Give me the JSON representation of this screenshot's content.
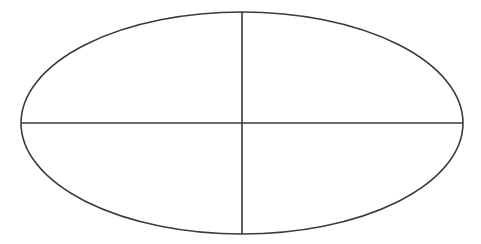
{
  "diagram": {
    "type": "ellipse-quadrants",
    "background": "#ffffff",
    "stroke_color": "#3a3a3a",
    "stroke_width": 1.6,
    "ellipse": {
      "cx": 242,
      "cy": 123,
      "rx": 221,
      "ry": 111
    },
    "horizontal_axis": {
      "x1": 21,
      "y1": 123,
      "x2": 463,
      "y2": 123
    },
    "vertical_axis": {
      "x1": 242,
      "y1": 12,
      "x2": 242,
      "y2": 234
    },
    "quadrants": 4
  }
}
